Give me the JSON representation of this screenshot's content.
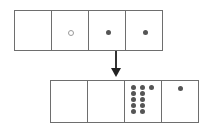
{
  "diagram": {
    "top_row": {
      "cells": [
        {
          "index": 0,
          "dots": []
        },
        {
          "index": 1,
          "dots": [
            {
              "x": 19,
              "y": 21,
              "style": "light"
            }
          ]
        },
        {
          "index": 2,
          "dots": [
            {
              "x": 19,
              "y": 21,
              "style": "dark"
            }
          ]
        },
        {
          "index": 3,
          "dots": [
            {
              "x": 19,
              "y": 21,
              "style": "dark"
            }
          ]
        }
      ]
    },
    "arrow": {
      "direction": "down"
    },
    "bottom_row": {
      "cells": [
        {
          "index": 0,
          "dots": []
        },
        {
          "index": 1,
          "dots": []
        },
        {
          "index": 2,
          "dots": [
            {
              "x": 9,
              "y": 7
            },
            {
              "x": 18,
              "y": 7
            },
            {
              "x": 27,
              "y": 7
            },
            {
              "x": 9,
              "y": 13
            },
            {
              "x": 18,
              "y": 13
            },
            {
              "x": 9,
              "y": 19
            },
            {
              "x": 18,
              "y": 19
            },
            {
              "x": 9,
              "y": 25
            },
            {
              "x": 18,
              "y": 25
            },
            {
              "x": 9,
              "y": 31
            },
            {
              "x": 18,
              "y": 31
            }
          ]
        },
        {
          "index": 3,
          "dots": [
            {
              "x": 18,
              "y": 7
            }
          ]
        }
      ]
    },
    "colors": {
      "line": "#6e6e6e",
      "dot_dark": "#555555",
      "dot_light_border": "#9a9a9a",
      "arrow": "#222222"
    }
  }
}
